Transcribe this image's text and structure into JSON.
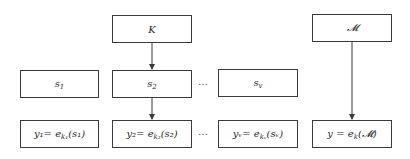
{
  "diagram": {
    "type": "flow",
    "nodes": {
      "key": {
        "label": "K"
      },
      "message": {
        "label": "𝓜"
      },
      "s1": {
        "label": "s",
        "sub": "1"
      },
      "s2": {
        "label": "s",
        "sub": "2"
      },
      "sv": {
        "label": "s",
        "sub": "v"
      },
      "y1": {
        "label": "y₁= e",
        "sub": "k₁",
        "arg": "(s₁)"
      },
      "y2": {
        "label": "y₂= e",
        "sub": "k₂",
        "arg": "(s₂)"
      },
      "yv": {
        "label": "yᵥ= e",
        "sub": "kᵥ",
        "arg": "(sᵥ)"
      },
      "y": {
        "label": "y = e",
        "sub": "k",
        "arg": "(𝓜)"
      }
    },
    "ellipsis_middle": "…",
    "ellipsis_bottom": "…",
    "edges": [
      {
        "from": "key",
        "to": "s2"
      },
      {
        "from": "s2",
        "to": "y2"
      },
      {
        "from": "message",
        "to": "y"
      }
    ],
    "colors": {
      "border": "#3a3a3a",
      "text": "#2a2a2a",
      "background": "#ffffff"
    }
  }
}
